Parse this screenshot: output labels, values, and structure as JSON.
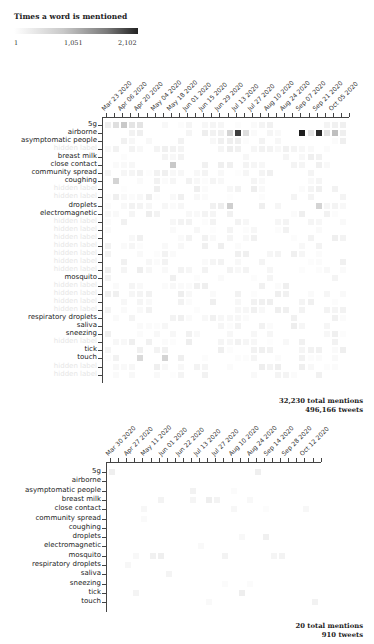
{
  "legend": {
    "title": "Times a word is mentioned",
    "ticks": [
      "1",
      "1,051",
      "2,102"
    ],
    "min": 1,
    "mid": 1051,
    "max": 2102
  },
  "chart_data": [
    {
      "type": "heatmap",
      "title": "",
      "x_tick_labels": [
        "Mar 23 2020",
        "Apr 06 2020",
        "Apr 20 2020",
        "May 04 2020",
        "May 18 2020",
        "Jun 01 2020",
        "Jun 15 2020",
        "Jun 29 2020",
        "Jul 13 2020",
        "Jul 27 2020",
        "Aug 10 2020",
        "Aug 24 2020",
        "Sep 07 2020",
        "Sep 21 2020",
        "Oct 05 2020"
      ],
      "rows": [
        {
          "label": "5g",
          "visible": true
        },
        {
          "label": "airborne",
          "visible": true
        },
        {
          "label": "asymptomatic people",
          "visible": true
        },
        {
          "label": "",
          "visible": false
        },
        {
          "label": "breast milk",
          "visible": true
        },
        {
          "label": "close contact",
          "visible": true
        },
        {
          "label": "community spread",
          "visible": true
        },
        {
          "label": "coughing",
          "visible": true
        },
        {
          "label": "",
          "visible": false
        },
        {
          "label": "",
          "visible": false
        },
        {
          "label": "droplets",
          "visible": true
        },
        {
          "label": "electromagnetic",
          "visible": true
        },
        {
          "label": "",
          "visible": false
        },
        {
          "label": "",
          "visible": false
        },
        {
          "label": "",
          "visible": false
        },
        {
          "label": "",
          "visible": false
        },
        {
          "label": "",
          "visible": false
        },
        {
          "label": "",
          "visible": false
        },
        {
          "label": "",
          "visible": false
        },
        {
          "label": "mosquito",
          "visible": true
        },
        {
          "label": "",
          "visible": false
        },
        {
          "label": "",
          "visible": false
        },
        {
          "label": "",
          "visible": false
        },
        {
          "label": "",
          "visible": false
        },
        {
          "label": "respiratory droplets",
          "visible": true
        },
        {
          "label": "saliva",
          "visible": true
        },
        {
          "label": "sneezing",
          "visible": true
        },
        {
          "label": "",
          "visible": false
        },
        {
          "label": "tick",
          "visible": true
        },
        {
          "label": "touch",
          "visible": true
        },
        {
          "label": "",
          "visible": false
        },
        {
          "label": "",
          "visible": false
        }
      ],
      "num_columns": 30,
      "highlights": [
        {
          "row": "5g",
          "col": 1,
          "value": 300
        },
        {
          "row": "5g",
          "col": 2,
          "value": 500
        },
        {
          "row": "5g",
          "col": 3,
          "value": 250
        },
        {
          "row": "5g",
          "col": 4,
          "value": 250
        },
        {
          "row": "airborne",
          "col": 15,
          "value": 400
        },
        {
          "row": "airborne",
          "col": 16,
          "value": 1800
        },
        {
          "row": "airborne",
          "col": 17,
          "value": 300
        },
        {
          "row": "airborne",
          "col": 24,
          "value": 2102
        },
        {
          "row": "airborne",
          "col": 25,
          "value": 250
        },
        {
          "row": "airborne",
          "col": 26,
          "value": 2000
        },
        {
          "row": "airborne",
          "col": 27,
          "value": 250
        },
        {
          "row": "airborne",
          "col": 28,
          "value": 600
        },
        {
          "row": "close contact",
          "col": 8,
          "value": 500
        },
        {
          "row": "coughing",
          "col": 1,
          "value": 400
        },
        {
          "row": "droplets",
          "col": 15,
          "value": 450
        },
        {
          "row": "droplets",
          "col": 26,
          "value": 400
        },
        {
          "row": "touch",
          "col": 4,
          "value": 350
        },
        {
          "row": "touch",
          "col": 7,
          "value": 400
        }
      ],
      "summary": {
        "total_mentions": "32,230 total mentions",
        "tweets": "496,166 tweets"
      }
    },
    {
      "type": "heatmap",
      "title": "",
      "x_tick_labels": [
        "Mar 30 2020",
        "Apr 27 2020",
        "May 11 2020",
        "Jun 01 2020",
        "Jun 22 2020",
        "Jul 13 2020",
        "Jul 27 2020",
        "Aug 10 2020",
        "Aug 24 2020",
        "Sep 14 2020",
        "Sep 28 2020",
        "Oct 12 2020"
      ],
      "rows": [
        {
          "label": "5g",
          "visible": true
        },
        {
          "label": "airborne",
          "visible": true
        },
        {
          "label": "asymptomatic people",
          "visible": true
        },
        {
          "label": "breast milk",
          "visible": true
        },
        {
          "label": "close contact",
          "visible": true
        },
        {
          "label": "community spread",
          "visible": true
        },
        {
          "label": "coughing",
          "visible": true
        },
        {
          "label": "droplets",
          "visible": true
        },
        {
          "label": "electromagnetic",
          "visible": true
        },
        {
          "label": "mosquito",
          "visible": true
        },
        {
          "label": "respiratory droplets",
          "visible": true
        },
        {
          "label": "saliva",
          "visible": true
        },
        {
          "label": "sneezing",
          "visible": true
        },
        {
          "label": "tick",
          "visible": true
        },
        {
          "label": "touch",
          "visible": true
        }
      ],
      "num_columns": 26,
      "summary": {
        "total_mentions": "20 total mentions",
        "tweets": "910 tweets"
      }
    }
  ]
}
